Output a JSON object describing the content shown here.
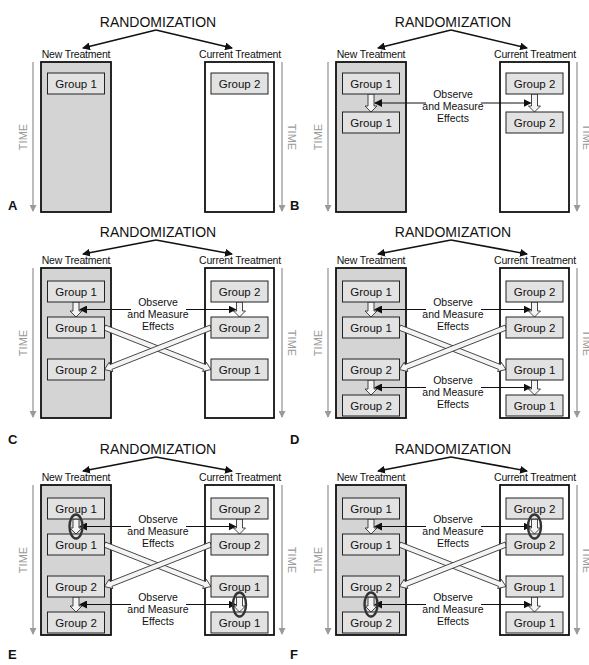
{
  "labels": {
    "randomization": "RANDOMIZATION",
    "new_treatment": "New Treatment",
    "current_treatment": "Current Treatment",
    "time": "TIME",
    "observe_line1": "Observe",
    "observe_line2": "and Measure",
    "observe_line3": "Effects"
  },
  "colors": {
    "new_treatment_fill": "#d4d4d4",
    "current_treatment_fill": "#ffffff",
    "group_box_fill": "#e2e2e2",
    "outline": "#111111",
    "time_arrow": "#9a9a9a",
    "ellipse": "#333333"
  },
  "panels": [
    {
      "letter": "A",
      "left_groups": [
        "Group 1"
      ],
      "right_groups": [
        "Group 2"
      ],
      "observe": [],
      "crossover": false,
      "highlights": []
    },
    {
      "letter": "B",
      "left_groups": [
        "Group 1",
        "Group 1"
      ],
      "right_groups": [
        "Group 2",
        "Group 2"
      ],
      "observe": [
        {
          "stage": 1,
          "left": true,
          "right": true
        }
      ],
      "crossover": false,
      "highlights": []
    },
    {
      "letter": "C",
      "left_groups": [
        "Group 1",
        "Group 1",
        "Group 2"
      ],
      "right_groups": [
        "Group 2",
        "Group 2",
        "Group 1"
      ],
      "observe": [
        {
          "stage": 1,
          "left": true,
          "right": true
        }
      ],
      "crossover": true,
      "highlights": []
    },
    {
      "letter": "D",
      "left_groups": [
        "Group 1",
        "Group 1",
        "Group 2",
        "Group 2"
      ],
      "right_groups": [
        "Group 2",
        "Group 2",
        "Group 1",
        "Group 1"
      ],
      "observe": [
        {
          "stage": 1,
          "left": true,
          "right": true
        },
        {
          "stage": 2,
          "left": true,
          "right": true
        }
      ],
      "crossover": true,
      "highlights": []
    },
    {
      "letter": "E",
      "left_groups": [
        "Group 1",
        "Group 1",
        "Group 2",
        "Group 2"
      ],
      "right_groups": [
        "Group 2",
        "Group 2",
        "Group 1",
        "Group 1"
      ],
      "observe": [
        {
          "stage": 1,
          "left": true,
          "right": true
        },
        {
          "stage": 2,
          "left": true,
          "right": true
        }
      ],
      "crossover": true,
      "highlights": [
        {
          "stage": 1,
          "side": "left"
        },
        {
          "stage": 2,
          "side": "right"
        }
      ]
    },
    {
      "letter": "F",
      "left_groups": [
        "Group 1",
        "Group 1",
        "Group 2",
        "Group 2"
      ],
      "right_groups": [
        "Group 2",
        "Group 2",
        "Group 1",
        "Group 1"
      ],
      "observe": [
        {
          "stage": 1,
          "left": true,
          "right": true
        },
        {
          "stage": 2,
          "left": true,
          "right": true
        }
      ],
      "crossover": true,
      "highlights": [
        {
          "stage": 1,
          "side": "right"
        },
        {
          "stage": 2,
          "side": "left"
        }
      ]
    }
  ]
}
